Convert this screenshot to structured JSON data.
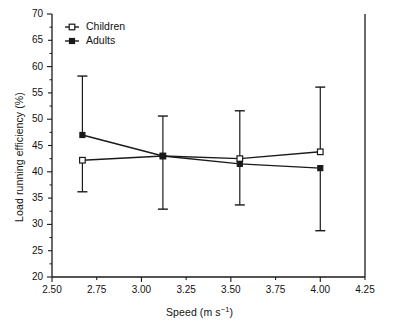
{
  "chart_data": {
    "type": "line",
    "title": "",
    "xlabel": "Speed (m s⁻¹)",
    "ylabel": "Load running efficiency (%)",
    "xlim": [
      2.5,
      4.25
    ],
    "ylim": [
      20,
      70
    ],
    "xticks": [
      2.5,
      3.0,
      3.5,
      4.0
    ],
    "xtick_labels": [
      "2.50",
      "2.75",
      "3.00",
      "3.25",
      "3.50",
      "3.75",
      "4.00",
      "4.25"
    ],
    "xtick_values": [
      2.5,
      2.75,
      3.0,
      3.25,
      3.5,
      3.75,
      4.0,
      4.25
    ],
    "ytick_labels": [
      "20",
      "25",
      "30",
      "35",
      "40",
      "45",
      "50",
      "55",
      "60",
      "65",
      "70"
    ],
    "ytick_values": [
      20,
      25,
      30,
      35,
      40,
      45,
      50,
      55,
      60,
      65,
      70
    ],
    "ytick_top_clipped": "70",
    "grid": false,
    "legend_position": "top-left",
    "x": [
      2.67,
      3.12,
      3.55,
      4.0
    ],
    "series": [
      {
        "name": "Children",
        "marker": "open-square",
        "values": [
          42.2,
          43.0,
          42.5,
          43.8
        ],
        "err_upper": [
          42.2,
          50.6,
          51.6,
          56.1
        ],
        "err_lower": [
          36.2,
          32.9,
          33.7,
          43.8
        ]
      },
      {
        "name": "Adults",
        "marker": "filled-square",
        "values": [
          47.0,
          43.0,
          41.5,
          40.7
        ],
        "err_upper": [
          58.2,
          43.0,
          41.5,
          40.7
        ],
        "err_lower": [
          47.0,
          43.0,
          41.5,
          28.8
        ]
      }
    ]
  },
  "legend": {
    "items": [
      {
        "label": "Children",
        "marker": "open-square"
      },
      {
        "label": "Adults",
        "marker": "filled-square"
      }
    ]
  },
  "colors": {
    "line": "#1a1a1a",
    "axis": "#1a1a1a",
    "background": "#ffffff"
  }
}
